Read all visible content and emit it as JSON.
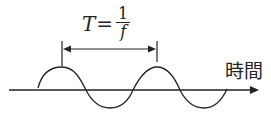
{
  "diagram": {
    "formula": {
      "lhs": "T",
      "equals": "=",
      "numerator": "1",
      "denominator": "f"
    },
    "axis_label": "時間",
    "period_annotation": "period T between two successive peaks",
    "colors": {
      "line": "#222222",
      "background": "#ffffff"
    }
  }
}
